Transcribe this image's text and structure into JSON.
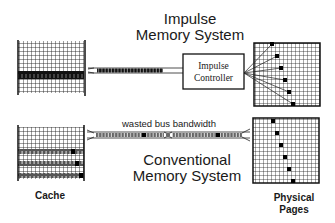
{
  "impulse": {
    "title_line1": "Impulse",
    "title_line2": "Memory System",
    "controller_line1": "Impulse",
    "controller_line2": "Controller"
  },
  "conventional": {
    "title_line1": "Conventional",
    "title_line2": "Memory System",
    "bus_annotation": "wasted bus bandwidth"
  },
  "labels": {
    "cache": "Cache",
    "physical_line1": "Physical",
    "physical_line2": "Pages"
  },
  "colors": {
    "ink": "#1a1a1a",
    "grid": "#222222",
    "background": "#ffffff"
  }
}
